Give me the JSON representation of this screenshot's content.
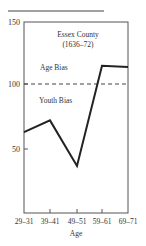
{
  "chart_data": {
    "type": "line",
    "title": "Essex County",
    "subtitle": "(1636–72)",
    "xlabel": "Age",
    "ylabel": "",
    "categories": [
      "29–31",
      "39–41",
      "49–51",
      "59–61",
      "69–71"
    ],
    "series": [
      {
        "name": "Essex County (1636–72)",
        "values": [
          63,
          72,
          37,
          114,
          113
        ]
      }
    ],
    "yticks": [
      50,
      100,
      150
    ],
    "ylim": [
      0,
      150
    ],
    "reference_line": {
      "y": 100,
      "style": "dashed"
    },
    "annotations": [
      {
        "text": "Age Bias",
        "position": "above reference line"
      },
      {
        "text": "Youth Bias",
        "position": "below reference line"
      }
    ],
    "grid": false,
    "legend": "none"
  },
  "labels": {
    "title_line1": "Essex County",
    "title_line2": "(1636–72)",
    "age_bias": "Age Bias",
    "youth_bias": "Youth Bias",
    "xlabel": "Age",
    "ytick_150": "150",
    "ytick_100": "100",
    "ytick_50": "50",
    "xtick_0": "29–31",
    "xtick_1": "39–41",
    "xtick_2": "49–51",
    "xtick_3": "59–61",
    "xtick_4": "69–71"
  }
}
